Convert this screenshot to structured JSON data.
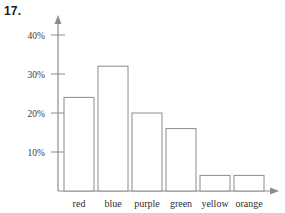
{
  "problem": {
    "number": "17."
  },
  "chart_data": {
    "type": "bar",
    "title": "",
    "xlabel": "",
    "ylabel": "",
    "categories": [
      "red",
      "blue",
      "purple",
      "green",
      "yellow",
      "orange"
    ],
    "values": [
      24,
      32,
      20,
      16,
      4,
      4
    ],
    "ylim": [
      0,
      44
    ],
    "y_ticks": [
      10,
      20,
      30,
      40
    ],
    "y_tick_labels": [
      "10%",
      "20%",
      "30%",
      "40%"
    ],
    "grid": false,
    "legend": null,
    "axis_arrows": {
      "y_axis": "up-arrow",
      "x_axis": "right-arrow"
    },
    "bar_style": {
      "fill": "#ffffff",
      "stroke": "#8c8c8c"
    }
  }
}
